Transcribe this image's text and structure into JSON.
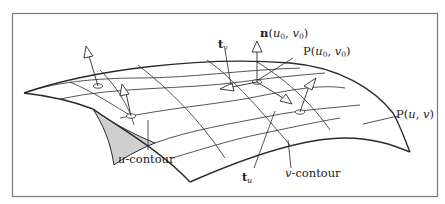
{
  "figure": {
    "frame_color": "#7a7a7a",
    "stroke_color": "#2a2a2a",
    "patch_fill": "#cfcfcf",
    "labels": {
      "normal": {
        "bold": "n",
        "args": "(u0, v0)",
        "u": "u",
        "v": "v",
        "sub0": "0"
      },
      "point0": {
        "prefix": "P(",
        "u": "u",
        "v": "v",
        "sub0": "0",
        "close": ")",
        "comma": ", "
      },
      "point": {
        "prefix": "P(",
        "u": "u",
        "v": "v",
        "comma": ", ",
        "close": ")"
      },
      "tv": {
        "bold": "t",
        "sub": "v"
      },
      "tu": {
        "bold": "t",
        "sub": "u"
      },
      "u_contour": {
        "var": "u",
        "text": "-contour"
      },
      "v_contour": {
        "var": "v",
        "text": "-contour"
      }
    }
  }
}
